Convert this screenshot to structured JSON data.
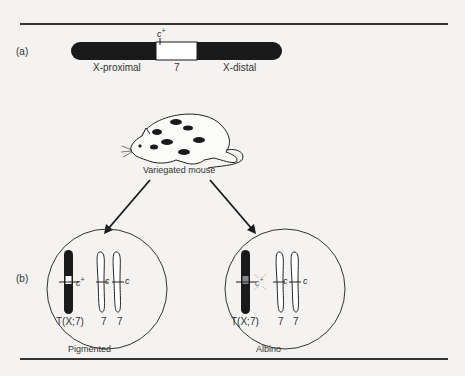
{
  "figure": {
    "panel_a": {
      "label": "(a)",
      "gene_marker": "c",
      "gene_marker_sup": "+",
      "segments": [
        {
          "name": "X-proximal",
          "fill": "#1a1a1a"
        },
        {
          "name": "7",
          "fill": "#ffffff"
        },
        {
          "name": "X-distal",
          "fill": "#1a1a1a"
        }
      ]
    },
    "mouse": {
      "caption": "Variegated mouse",
      "icon": "spotted-mouse-icon"
    },
    "panel_b": {
      "label": "(b)",
      "cells": [
        {
          "caption": "Pigmented",
          "translocation_label": "T(X;7)",
          "translocation_allele": "c",
          "translocation_allele_sup": "+",
          "allele_state": "active",
          "normal_chromosomes": [
            {
              "label": "7",
              "allele": "c"
            },
            {
              "label": "7",
              "allele": "c"
            }
          ]
        },
        {
          "caption": "Albino",
          "translocation_label": "T(X;7)",
          "translocation_allele": "c",
          "translocation_allele_sup": "+",
          "allele_state": "inactivated",
          "normal_chromosomes": [
            {
              "label": "7",
              "allele": "c"
            },
            {
              "label": "7",
              "allele": "c"
            }
          ]
        }
      ]
    },
    "colors": {
      "background": "#f4f3f1",
      "ink": "#1a1a1a",
      "rule": "#333333"
    }
  }
}
